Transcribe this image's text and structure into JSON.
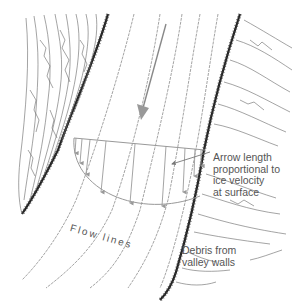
{
  "diagram": {
    "labels": {
      "arrow_note": {
        "line1": "Arrow length",
        "line2": "proportional to",
        "line3": "ice velocity",
        "line4": "at surface"
      },
      "flow_lines": "Flow lines",
      "debris": {
        "line1": "Debris from",
        "line2": "valley walls"
      }
    },
    "colors": {
      "background": "#ffffff",
      "flow_line": "#9a9a9a",
      "valley_wall": "#333333",
      "text": "#555555"
    },
    "elements": {
      "flow_line_count": 7,
      "velocity_arrow_count": 9,
      "main_flow_arrow": "large downward arrow indicating glacier flow direction"
    }
  }
}
